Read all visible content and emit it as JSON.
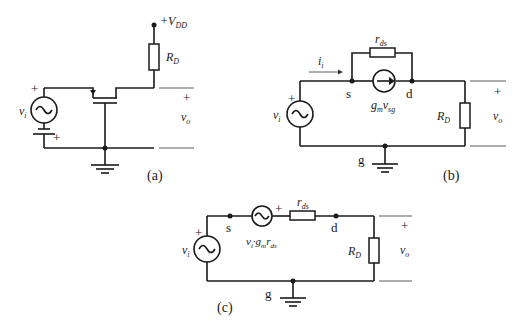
{
  "figure": {
    "panel_a": {
      "caption": "(a)",
      "supply": "+V",
      "supply_sub": "DD",
      "resistor": "R",
      "resistor_sub": "D",
      "source": "v",
      "source_sub": "i",
      "plus_source": "+",
      "plus_battery": "+",
      "out_plus": "+",
      "out": "v",
      "out_sub": "o"
    },
    "panel_b": {
      "caption": "(b)",
      "current": "i",
      "current_sub": "i",
      "rds": "r",
      "rds_sub": "ds",
      "node_s": "s",
      "node_d": "d",
      "node_g": "g",
      "gm": "g",
      "gm_sub": "m",
      "gm_v": "v",
      "gm_v_sub": "sg",
      "source": "v",
      "source_sub": "i",
      "plus": "+",
      "resistor": "R",
      "resistor_sub": "D",
      "out_plus": "+",
      "out": "v",
      "out_sub": "o"
    },
    "panel_c": {
      "caption": "(c)",
      "rds": "r",
      "rds_sub": "ds",
      "node_s": "s",
      "node_d": "d",
      "node_g": "g",
      "dep_src_label": "v",
      "dep_src_sub": "i",
      "dep_src_mid": "·g",
      "dep_src_mid_sub": "m",
      "dep_src_r": "r",
      "dep_src_r_sub": "ds",
      "dep_plus": "+",
      "source": "v",
      "source_sub": "i",
      "plus": "+",
      "resistor": "R",
      "resistor_sub": "D",
      "out_plus": "+",
      "out": "v",
      "out_sub": "o"
    }
  }
}
